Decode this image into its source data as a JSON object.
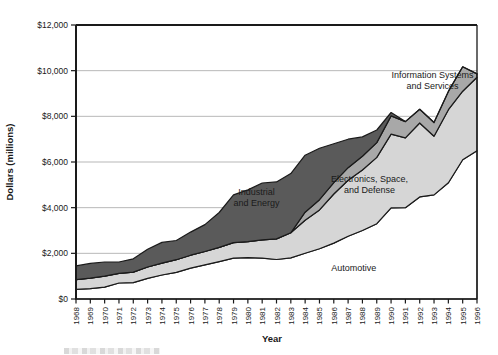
{
  "chart_data": {
    "type": "area",
    "stacked": true,
    "xlabel": "Year",
    "ylabel": "Dollars (millions)",
    "x": [
      1968,
      1969,
      1970,
      1971,
      1972,
      1973,
      1974,
      1975,
      1976,
      1977,
      1978,
      1979,
      1980,
      1981,
      1982,
      1983,
      1984,
      1985,
      1986,
      1987,
      1988,
      1989,
      1990,
      1991,
      1992,
      1993,
      1994,
      1995,
      1996
    ],
    "x_tick_labels": [
      "1968",
      "1969",
      "1970",
      "1971",
      "1972",
      "1973",
      "1974",
      "1975",
      "1976",
      "1977",
      "1978",
      "1979",
      "1980",
      "1981",
      "1982",
      "1983",
      "1984",
      "1985",
      "1986",
      "1987",
      "1988",
      "1989",
      "1990",
      "1991",
      "1992",
      "1993",
      "1994",
      "1995",
      "1996"
    ],
    "ylim": [
      0,
      12000
    ],
    "y_ticks": [
      0,
      2000,
      4000,
      6000,
      8000,
      10000,
      12000
    ],
    "y_tick_labels": [
      "$0",
      "$2,000",
      "$4,000",
      "$6,000",
      "$8,000",
      "$10,000",
      "$12,000"
    ],
    "grid": "horizontal",
    "axis_color": "#1a1a1a",
    "grid_color": "#9a9a9a",
    "outline_color": "#1a1a1a",
    "series": [
      {
        "name": "Automotive",
        "color": "#ffffff",
        "values": [
          420,
          450,
          520,
          700,
          720,
          900,
          1050,
          1170,
          1350,
          1500,
          1640,
          1790,
          1810,
          1790,
          1730,
          1800,
          2000,
          2200,
          2450,
          2750,
          3000,
          3300,
          3990,
          4000,
          4470,
          4560,
          5090,
          6100,
          6490
        ]
      },
      {
        "name": "Electronics, Space, and Defense",
        "color": "#d6d6d6",
        "values": [
          430,
          460,
          480,
          420,
          460,
          500,
          520,
          550,
          570,
          580,
          620,
          680,
          700,
          800,
          900,
          1100,
          1450,
          1700,
          2150,
          2450,
          2650,
          2900,
          3230,
          3060,
          3240,
          2570,
          3200,
          3000,
          3220
        ]
      },
      {
        "name": "Information Systems and Services",
        "color": "#a8a8a8",
        "values": [
          0,
          0,
          0,
          0,
          0,
          0,
          0,
          0,
          0,
          0,
          0,
          0,
          0,
          0,
          0,
          0,
          350,
          450,
          500,
          550,
          600,
          650,
          800,
          710,
          600,
          600,
          800,
          1070,
          150
        ]
      },
      {
        "name": "Industrial and Energy",
        "color": "#5a5a5a",
        "values": [
          600,
          650,
          620,
          500,
          580,
          780,
          910,
          840,
          1010,
          1180,
          1530,
          2090,
          2270,
          2490,
          2500,
          2590,
          2500,
          2250,
          1700,
          1250,
          850,
          550,
          150,
          0,
          0,
          0,
          0,
          0,
          0
        ]
      }
    ],
    "annotations": [
      {
        "lines": [
          "Information Systems",
          "and Services"
        ],
        "x": 1992.9,
        "value": 9680,
        "color": "#1a1a1a"
      },
      {
        "lines": [
          "Electronics, Space,",
          "and Defense"
        ],
        "x": 1988.5,
        "value": 5130,
        "color": "#1a1a1a"
      },
      {
        "lines": [
          "Industrial",
          "and Energy"
        ],
        "x": 1980.6,
        "value": 4560,
        "color": "#ffffff"
      },
      {
        "lines": [
          "Automotive"
        ],
        "x": 1987.4,
        "value": 1230,
        "color": "#1a1a1a"
      }
    ],
    "legend": "none"
  }
}
